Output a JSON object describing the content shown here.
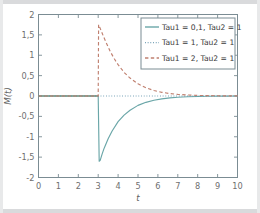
{
  "chart_data": {
    "type": "line",
    "title": "",
    "xlabel": "t",
    "ylabel": "M(t)",
    "xlim": [
      0,
      10
    ],
    "ylim": [
      -2,
      2
    ],
    "grid": false,
    "legend_position": "top-right",
    "xticks": [
      "0",
      "1",
      "2",
      "3",
      "4",
      "5",
      "6",
      "7",
      "8",
      "9",
      "10"
    ],
    "xtick_values": [
      0,
      1,
      2,
      3,
      4,
      5,
      6,
      7,
      8,
      9,
      10
    ],
    "yticks": [
      "2",
      "1,5",
      "1",
      "0,5",
      "0",
      "-0,5",
      "-1",
      "-1,5",
      "-2"
    ],
    "ytick_values": [
      2,
      1.5,
      1,
      0.5,
      0,
      -0.5,
      -1,
      -1.5,
      -2
    ],
    "event_time": 3,
    "series": [
      {
        "name": "Tau1 = 0,1, Tau2 = 1",
        "style": "solid",
        "color": "#6aa6a8",
        "peak_value": -1.6,
        "x": [
          0,
          0.5,
          1,
          1.5,
          2,
          2.5,
          2.9,
          3.0,
          3.05,
          3.1,
          3.2,
          3.3,
          3.5,
          3.7,
          4.0,
          4.3,
          4.6,
          5.0,
          5.4,
          5.8,
          6.2,
          6.6,
          7.0,
          7.5,
          8.0,
          8.5,
          9.0,
          9.5,
          10
        ],
        "y": [
          0,
          0,
          0,
          0,
          0,
          0,
          0,
          0,
          -1.6,
          -1.58,
          -1.42,
          -1.28,
          -1.05,
          -0.86,
          -0.63,
          -0.47,
          -0.35,
          -0.23,
          -0.155,
          -0.104,
          -0.07,
          -0.047,
          -0.031,
          -0.019,
          -0.011,
          -0.007,
          -0.004,
          -0.002,
          -0.001
        ]
      },
      {
        "name": "Tau1 = 1, Tau2 = 1",
        "style": "dotted",
        "color": "#5b8fa8",
        "peak_value": 0,
        "x": [
          0,
          1,
          2,
          3,
          4,
          5,
          6,
          7,
          8,
          9,
          10
        ],
        "y": [
          0,
          0,
          0,
          0,
          0,
          0,
          0,
          0,
          0,
          0,
          0
        ]
      },
      {
        "name": "Tau1 = 2, Tau2 = 1",
        "style": "dashed",
        "color": "#c08070",
        "peak_value": 1.75,
        "x": [
          0,
          0.5,
          1,
          1.5,
          2,
          2.5,
          2.9,
          3.0,
          3.02,
          3.1,
          3.25,
          3.4,
          3.6,
          3.8,
          4.0,
          4.3,
          4.6,
          5.0,
          5.4,
          5.8,
          6.2,
          6.6,
          7.0,
          7.5,
          8.0,
          8.5,
          9.0,
          9.5,
          10
        ],
        "y": [
          0,
          0,
          0,
          0,
          0,
          0,
          0,
          0,
          1.75,
          1.66,
          1.48,
          1.31,
          1.1,
          0.92,
          0.77,
          0.58,
          0.44,
          0.3,
          0.2,
          0.135,
          0.09,
          0.06,
          0.04,
          0.024,
          0.014,
          0.009,
          0.005,
          0.003,
          0.002
        ]
      }
    ],
    "baseline": {
      "name": "zero-baseline",
      "color": "#8c8c5e",
      "y": 0,
      "x_start": 0,
      "x_end": 3
    }
  }
}
